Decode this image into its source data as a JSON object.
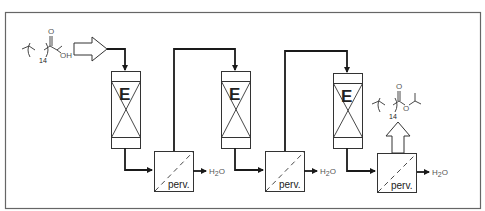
{
  "diagram": {
    "type": "process-flow",
    "frame": {
      "x": 5,
      "y": 12,
      "width": 476,
      "height": 197
    },
    "feed": {
      "molecule": "palmitic acid (C16 fatty acid)",
      "repeat_subscript": "14",
      "group_label": "OH",
      "carbonyl_label": "O"
    },
    "product": {
      "molecule": "isopropyl palmitate (ester)",
      "repeat_subscript": "14",
      "ester_oxygen_label": "O",
      "carbonyl_label": "O"
    },
    "reactors": [
      {
        "id": "reactor-1",
        "label": "E"
      },
      {
        "id": "reactor-2",
        "label": "E"
      },
      {
        "id": "reactor-3",
        "label": "E"
      }
    ],
    "pervaporation_units": [
      {
        "id": "perv-1",
        "label": "perv.",
        "outlet_label": "H",
        "outlet_sub": "2",
        "outlet_suffix": "O"
      },
      {
        "id": "perv-2",
        "label": "perv.",
        "outlet_label": "H",
        "outlet_sub": "2",
        "outlet_suffix": "O"
      },
      {
        "id": "perv-3",
        "label": "perv.",
        "outlet_label": "H",
        "outlet_sub": "2",
        "outlet_suffix": "O"
      }
    ],
    "colors": {
      "line": "#1a1a1a",
      "frame": "#555555",
      "background": "#ffffff"
    }
  }
}
